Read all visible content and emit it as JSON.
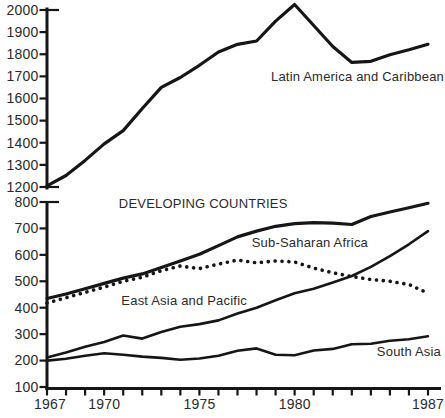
{
  "chart_data": {
    "type": "line",
    "title": "",
    "xlabel": "",
    "ylabel": "",
    "grid": false,
    "legend": "inline-labels",
    "xlim": [
      1967,
      1987.7
    ],
    "x": [
      1967,
      1968,
      1969,
      1970,
      1971,
      1972,
      1973,
      1974,
      1975,
      1976,
      1977,
      1978,
      1979,
      1980,
      1981,
      1982,
      1983,
      1984,
      1985,
      1986,
      1987
    ],
    "x_tick_years": [
      1967,
      1970,
      1975,
      1980,
      1987
    ],
    "x_tick_labels": [
      "1967",
      "1970",
      "1975",
      "1980",
      "1987"
    ],
    "panels": [
      {
        "name": "upper-panel",
        "ylim": [
          1200,
          2000
        ],
        "y_ticks": [
          "2000",
          "1900",
          "1800",
          "1700",
          "1600",
          "1500",
          "1400",
          "1300",
          "1200"
        ],
        "series": [
          {
            "name": "Latin America and Caribbean",
            "line_style": "solid",
            "values": [
              1205,
              1252,
              1320,
              1395,
              1455,
              1555,
              1650,
              1695,
              1750,
              1810,
              1845,
              1860,
              1950,
              2025,
              1930,
              1835,
              1763,
              1768,
              1798,
              1820,
              1845
            ],
            "label": {
              "text": "Latin America and Caribbean",
              "anchor_year": 1983.3,
              "anchor_value": 1680
            }
          }
        ]
      },
      {
        "name": "lower-panel",
        "ylim": [
          100,
          800
        ],
        "y_ticks": [
          "800",
          "700",
          "600",
          "500",
          "400",
          "300",
          "200",
          "100"
        ],
        "series": [
          {
            "name": "Developing countries",
            "line_style": "solid",
            "values": [
              435,
              452,
              472,
              492,
              512,
              528,
              552,
              577,
              602,
              635,
              668,
              690,
              708,
              718,
              722,
              720,
              715,
              745,
              762,
              778,
              795
            ],
            "label": {
              "text": "DEVELOPING COUNTRIES",
              "anchor_year": 1975.2,
              "anchor_value": 778
            }
          },
          {
            "name": "Sub-Saharan Africa",
            "line_style": "dotted",
            "values": [
              418,
              438,
              458,
              478,
              500,
              515,
              540,
              558,
              548,
              565,
              580,
              570,
              577,
              573,
              550,
              532,
              518,
              507,
              500,
              488,
              455
            ],
            "label": {
              "text": "Sub-Saharan Africa",
              "anchor_year": 1980.8,
              "anchor_value": 628
            }
          },
          {
            "name": "East Asia and Pacific",
            "line_style": "solid",
            "values": [
              212,
              230,
              252,
              270,
              295,
              283,
              308,
              328,
              338,
              352,
              378,
              400,
              428,
              455,
              472,
              495,
              520,
              555,
              595,
              640,
              690
            ],
            "label": {
              "text": "East Asia and Pacific",
              "anchor_year": 1974.2,
              "anchor_value": 410
            }
          },
          {
            "name": "South Asia",
            "line_style": "solid",
            "values": [
              200,
              207,
              218,
              228,
              222,
              215,
              210,
              203,
              208,
              218,
              237,
              246,
              222,
              220,
              238,
              244,
              262,
              264,
              275,
              281,
              292
            ],
            "label": {
              "text": "South Asia",
              "anchor_year": 1986.0,
              "anchor_value": 218
            }
          }
        ]
      }
    ],
    "colors": {
      "line": "#161616",
      "text": "#2b2b2b",
      "background": "#ffffff"
    }
  }
}
